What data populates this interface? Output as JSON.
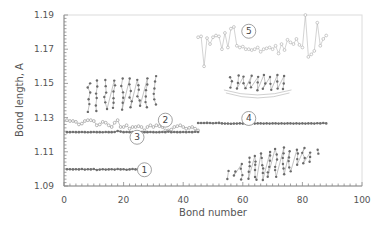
{
  "chart_data": {
    "type": "scatter",
    "title": "",
    "xlabel": "Bond number",
    "ylabel": "Bond length, A",
    "xlim": [
      0,
      100
    ],
    "ylim": [
      1.09,
      1.19
    ],
    "xticks": [
      "0",
      "20",
      "40",
      "60",
      "80",
      "100"
    ],
    "yticks": [
      "1.09",
      "1.11",
      "1.13",
      "1.15",
      "1.17",
      "1.19"
    ],
    "grid": false,
    "legend": "none (series identified by circled numbers 1-5)",
    "series": [
      {
        "name": "1",
        "color": "#707070",
        "marker": "filled-circle",
        "x_range": [
          1,
          25
        ],
        "values_approx": 1.0997,
        "x": [
          1,
          2,
          3,
          4,
          5,
          6,
          7,
          8,
          9,
          10,
          11,
          12,
          13,
          14,
          15,
          16,
          17,
          18,
          19,
          20,
          21,
          22,
          23,
          24,
          25
        ],
        "y": [
          1.0998,
          1.0998,
          1.0997,
          1.0998,
          1.0997,
          1.0999,
          1.0996,
          1.0998,
          1.0997,
          1.0999,
          1.0994,
          1.0996,
          1.0998,
          1.0996,
          1.0997,
          1.0998,
          1.0996,
          1.0999,
          1.0997,
          1.0998,
          1.0995,
          1.0997,
          1.0999,
          1.0997,
          1.0998
        ]
      },
      {
        "name": "2",
        "color": "#9a9a9a",
        "marker": "open-circle",
        "x_range": [
          1,
          45
        ],
        "x": [
          1,
          2,
          3,
          4,
          5,
          6,
          7,
          8,
          9,
          10,
          11,
          12,
          13,
          14,
          15,
          16,
          17,
          18,
          19,
          20,
          21,
          22,
          23,
          24,
          25,
          26,
          27,
          28,
          29,
          30,
          31,
          32,
          33,
          34,
          35,
          36,
          37,
          38,
          39,
          40,
          41,
          42,
          43,
          44,
          45
        ],
        "y": [
          1.1285,
          1.128,
          1.128,
          1.1275,
          1.126,
          1.1265,
          1.128,
          1.1285,
          1.1285,
          1.128,
          1.1255,
          1.126,
          1.1275,
          1.127,
          1.1255,
          1.1245,
          1.127,
          1.1285,
          1.1245,
          1.1245,
          1.1255,
          1.1235,
          1.1245,
          1.1245,
          1.125,
          1.1245,
          1.1225,
          1.1245,
          1.1255,
          1.1245,
          1.1255,
          1.125,
          1.1245,
          1.1225,
          1.1225,
          1.123,
          1.1245,
          1.125,
          1.1255,
          1.1245,
          1.1235,
          1.124,
          1.1245,
          1.1235,
          1.1225
        ]
      },
      {
        "name": "3",
        "color": "#707070",
        "marker": "filled-circle",
        "x_range": [
          1,
          45
        ],
        "values_approx": 1.1215,
        "x": [
          1,
          2,
          3,
          4,
          5,
          6,
          7,
          8,
          9,
          10,
          11,
          12,
          13,
          14,
          15,
          16,
          17,
          18,
          19,
          20,
          21,
          22,
          23,
          24,
          25,
          26,
          27,
          28,
          29,
          30,
          31,
          32,
          33,
          34,
          35,
          36,
          37,
          38,
          39,
          40,
          41,
          42,
          43,
          44,
          45
        ],
        "y": [
          1.1215,
          1.1215,
          1.1216,
          1.1215,
          1.1215,
          1.1216,
          1.1215,
          1.1214,
          1.1215,
          1.1216,
          1.1215,
          1.1215,
          1.1214,
          1.1216,
          1.1215,
          1.1215,
          1.1216,
          1.1222,
          1.1218,
          1.1215,
          1.1216,
          1.1215,
          1.1215,
          1.1216,
          1.1215,
          1.1216,
          1.1215,
          1.1215,
          1.1216,
          1.1215,
          1.1214,
          1.1215,
          1.1216,
          1.1215,
          1.1218,
          1.1215,
          1.1216,
          1.1215,
          1.1215,
          1.1216,
          1.1215,
          1.1216,
          1.1215,
          1.1217,
          1.1216
        ]
      },
      {
        "name": "4",
        "color": "#707070",
        "marker": "filled-circle",
        "x_range": [
          45,
          88
        ],
        "values_approx": 1.1265,
        "x": [
          45,
          46,
          47,
          48,
          49,
          50,
          51,
          52,
          53,
          54,
          55,
          56,
          57,
          58,
          59,
          60,
          61,
          62,
          63,
          64,
          65,
          66,
          67,
          68,
          69,
          70,
          71,
          72,
          73,
          74,
          75,
          76,
          77,
          78,
          79,
          80,
          81,
          82,
          83,
          84,
          85,
          86,
          87,
          88
        ],
        "y": [
          1.1268,
          1.1268,
          1.1268,
          1.1269,
          1.1268,
          1.1267,
          1.1268,
          1.1269,
          1.1266,
          1.1265,
          1.1265,
          1.1264,
          1.1265,
          1.1265,
          1.1266,
          1.1265,
          1.1265,
          1.1263,
          1.1266,
          1.1265,
          1.1266,
          1.1266,
          1.1265,
          1.1266,
          1.1265,
          1.1266,
          1.1266,
          1.1265,
          1.1266,
          1.1265,
          1.1266,
          1.1266,
          1.1265,
          1.1266,
          1.1265,
          1.1266,
          1.1265,
          1.1266,
          1.1266,
          1.1265,
          1.1267,
          1.1266,
          1.1268,
          1.1266
        ]
      },
      {
        "name": "5",
        "color": "#b5b5b5",
        "marker": "open-circle",
        "x_range": [
          45,
          88
        ],
        "x": [
          45,
          46,
          47,
          48,
          49,
          50,
          51,
          52,
          53,
          54,
          55,
          56,
          57,
          58,
          59,
          60,
          61,
          62,
          63,
          64,
          65,
          66,
          67,
          68,
          69,
          70,
          71,
          72,
          73,
          74,
          75,
          76,
          77,
          78,
          79,
          80,
          81,
          82,
          83,
          84,
          85,
          86,
          87,
          88
        ],
        "y": [
          1.177,
          1.1775,
          1.16,
          1.1765,
          1.173,
          1.177,
          1.178,
          1.1775,
          1.17,
          1.1795,
          1.171,
          1.182,
          1.183,
          1.172,
          1.171,
          1.1715,
          1.17,
          1.17,
          1.1695,
          1.17,
          1.171,
          1.1685,
          1.17,
          1.1705,
          1.171,
          1.17,
          1.172,
          1.1675,
          1.173,
          1.1695,
          1.1755,
          1.174,
          1.173,
          1.176,
          1.1725,
          1.171,
          1.19,
          1.1655,
          1.167,
          1.169,
          1.1855,
          1.172,
          1.176,
          1.178
        ]
      }
    ],
    "annotations": [
      {
        "label": "1",
        "x": 27,
        "y": 1.0995,
        "shape": "circle"
      },
      {
        "label": "2",
        "x": 34,
        "y": 1.1285,
        "shape": "circle"
      },
      {
        "label": "3",
        "x": 24.5,
        "y": 1.1185,
        "shape": "circle"
      },
      {
        "label": "4",
        "x": 62,
        "y": 1.1295,
        "shape": "circle"
      },
      {
        "label": "5",
        "x": 62,
        "y": 1.1805,
        "shape": "circle"
      },
      {
        "label": "molecule-image-graphene-nanoribbon",
        "x_range": [
          7,
          32
        ],
        "y_range": [
          1.134,
          1.154
        ]
      },
      {
        "label": "molecule-image-curved-fragment",
        "x_range": [
          55,
          75
        ],
        "y_range": [
          1.145,
          1.156
        ]
      },
      {
        "label": "molecule-image-diamond-like-slab",
        "x_range": [
          54,
          86
        ],
        "y_range": [
          1.094,
          1.112
        ]
      }
    ]
  }
}
